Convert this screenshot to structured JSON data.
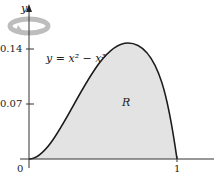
{
  "figure": {
    "curve_label": "y = x² − x³",
    "region_label": "R",
    "y_axis_label": "y",
    "y_ticks": [
      "0.14",
      "0.07"
    ],
    "x_ticks": [
      "0",
      "1"
    ],
    "colors": {
      "fill": "#e3e3e3",
      "curve": "#1a1a1a",
      "axis": "#333333",
      "rotation_arrow": "#b8b8b8"
    }
  }
}
